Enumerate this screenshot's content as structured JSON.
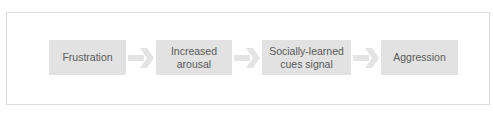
{
  "diagram": {
    "type": "flowchart",
    "direction": "left-to-right",
    "nodes": [
      {
        "id": "n1",
        "label": "Frustration"
      },
      {
        "id": "n2",
        "label": "Increased\narousal"
      },
      {
        "id": "n3",
        "label": "Socially-learned\ncues signal"
      },
      {
        "id": "n4",
        "label": "Aggression"
      }
    ],
    "edges": [
      {
        "from": "n1",
        "to": "n2"
      },
      {
        "from": "n2",
        "to": "n3"
      },
      {
        "from": "n3",
        "to": "n4"
      }
    ],
    "colors": {
      "node_fill": "#e2e2e2",
      "arrow": "#e4e4e4",
      "text": "#5a5a5a",
      "frame_border": "#dcdcdc"
    }
  }
}
